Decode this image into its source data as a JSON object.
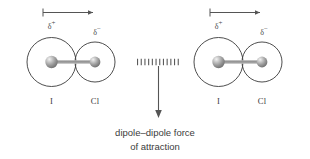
{
  "diagram": {
    "background_color": "#ffffff",
    "stroke_color": "#3a3a3a",
    "molecules": [
      {
        "id": "molecule-left",
        "atoms": [
          {
            "symbol": "I",
            "label": "I",
            "partial_charge": "δ",
            "charge_sign": "+"
          },
          {
            "symbol": "Cl",
            "label": "Cl",
            "partial_charge": "δ",
            "charge_sign": "−"
          }
        ],
        "dipole_arrow": {
          "direction": "right",
          "tail": "cross"
        }
      },
      {
        "id": "molecule-right",
        "atoms": [
          {
            "symbol": "I",
            "label": "I",
            "partial_charge": "δ",
            "charge_sign": "+"
          },
          {
            "symbol": "Cl",
            "label": "Cl",
            "partial_charge": "δ",
            "charge_sign": "−"
          }
        ],
        "dipole_arrow": {
          "direction": "right",
          "tail": "cross"
        }
      }
    ],
    "interaction": {
      "style": "dotted-line",
      "label_line_1": "dipole–dipole force",
      "label_line_2": "of attraction",
      "pointer": "down-arrow"
    }
  }
}
